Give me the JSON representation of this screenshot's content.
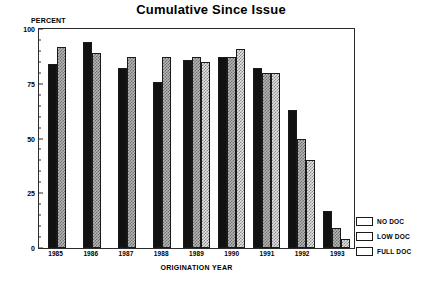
{
  "chart_data": {
    "type": "bar",
    "title": "Cumulative Since Issue",
    "xlabel": "ORIGINATION YEAR",
    "ylabel": "PERCENT",
    "categories": [
      "1985",
      "1986",
      "1987",
      "1988",
      "1989",
      "1990",
      "1991",
      "1992",
      "1993"
    ],
    "ylim": [
      0,
      100
    ],
    "yticks": [
      0,
      25,
      50,
      75,
      100
    ],
    "ytick_labels": [
      "0",
      "25",
      "50",
      "75",
      "100"
    ],
    "grid": false,
    "legend_position": "right-bottom",
    "series": [
      {
        "name": "FULL DOC",
        "key": "full",
        "color": "#111111",
        "values": [
          84,
          94,
          82,
          76,
          86,
          87,
          82,
          63,
          17
        ]
      },
      {
        "name": "LOW DOC",
        "key": "low",
        "color": "#b6b6b6",
        "values": [
          92,
          89,
          87,
          87,
          87,
          87,
          80,
          50,
          9
        ]
      },
      {
        "name": "NO DOC",
        "key": "no",
        "color": "#e2e2e2",
        "values": [
          null,
          null,
          null,
          null,
          85,
          91,
          80,
          40,
          4
        ]
      }
    ]
  },
  "legend": {
    "items": [
      {
        "label": "NO DOC",
        "key": "no"
      },
      {
        "label": "LOW DOC",
        "key": "low"
      },
      {
        "label": "FULL DOC",
        "key": "full"
      }
    ]
  }
}
